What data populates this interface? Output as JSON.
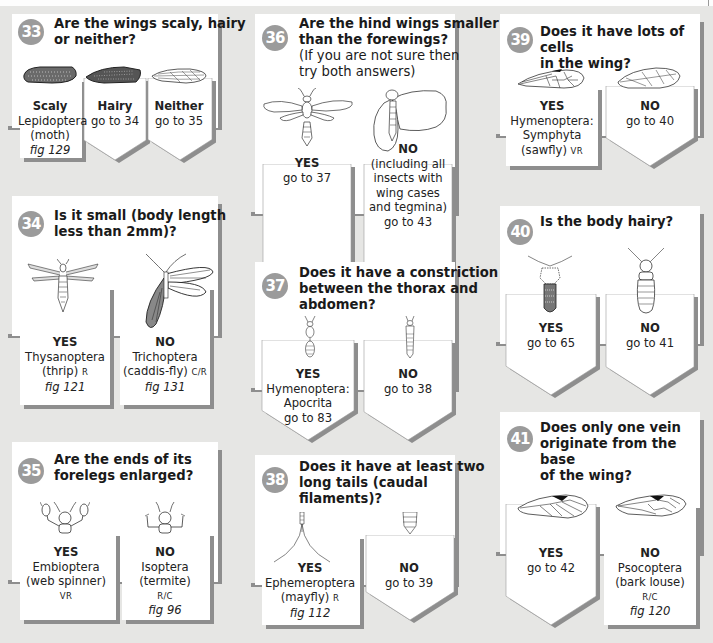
{
  "colors": {
    "background": "#e6e6e4",
    "card": "#ffffff",
    "shadow": "#8e8e8e",
    "badge": "#9b9b9b"
  },
  "cards": [
    {
      "id": "33",
      "question": "Are the wings scaly, hairy or neither?",
      "question_lines": [
        "Are the wings scaly, hairy",
        "or neither?"
      ],
      "options": [
        {
          "label": "Scaly",
          "lines": [
            "Lepidoptera",
            "(moth)"
          ],
          "fig": "fig 129",
          "terminal": true,
          "illustration": "scaly-wing"
        },
        {
          "label": "Hairy",
          "lines": [
            "go to 34"
          ],
          "terminal": false,
          "illustration": "hairy-wing"
        },
        {
          "label": "Neither",
          "lines": [
            "go to 35"
          ],
          "terminal": false,
          "illustration": "veined-wing"
        }
      ]
    },
    {
      "id": "34",
      "question_lines": [
        "Is it small (body length",
        "less than 2mm)?"
      ],
      "options": [
        {
          "label": "YES",
          "lines": [
            "Thysanoptera"
          ],
          "line2": "(thrip)",
          "status": "R",
          "fig": "fig 121",
          "terminal": true,
          "illustration": "thrip"
        },
        {
          "label": "NO",
          "lines": [
            "Trichoptera"
          ],
          "line2": "(caddis-fly)",
          "status": "C/R",
          "fig": "fig 131",
          "terminal": true,
          "illustration": "caddis-fly"
        }
      ]
    },
    {
      "id": "35",
      "question_lines": [
        "Are the ends of its",
        "forelegs enlarged?"
      ],
      "options": [
        {
          "label": "YES",
          "lines": [
            "Embioptera",
            "(web spinner)"
          ],
          "status": "VR",
          "terminal": true,
          "illustration": "web-spinner-head"
        },
        {
          "label": "NO",
          "lines": [
            "Isoptera",
            "(termite)"
          ],
          "status": "R/C",
          "fig": "fig 96",
          "terminal": true,
          "illustration": "termite-head"
        }
      ]
    },
    {
      "id": "36",
      "question_lines": [
        "Are the hind wings smaller",
        "than the forewings?"
      ],
      "sub_lines": [
        "(If you are not sure then",
        "try both answers)"
      ],
      "options": [
        {
          "label": "YES",
          "lines": [
            "go to 37"
          ],
          "terminal": false,
          "illustration": "wasp"
        },
        {
          "label": "NO",
          "lines": [
            "(including all",
            "insects with",
            "wing cases",
            "and tegmina)",
            "go to 43"
          ],
          "terminal": false,
          "illustration": "bug-with-wing-cases"
        }
      ]
    },
    {
      "id": "37",
      "question_lines": [
        "Does it have a constriction",
        "between the thorax and",
        "abdomen?"
      ],
      "options": [
        {
          "label": "YES",
          "lines": [
            "Hymenoptera:",
            "Apocrita",
            "go to 83"
          ],
          "terminal": false,
          "illustration": "constricted-body"
        },
        {
          "label": "NO",
          "lines": [
            "go to 38"
          ],
          "terminal": false,
          "illustration": "unconstricted-body"
        }
      ]
    },
    {
      "id": "38",
      "question_lines": [
        "Does it have at least two",
        "long tails (caudal",
        "filaments)?"
      ],
      "options": [
        {
          "label": "YES",
          "lines": [
            "Ephemeroptera"
          ],
          "line2": "(mayfly)",
          "status": "R",
          "fig": "fig 112",
          "terminal": true,
          "illustration": "tails"
        },
        {
          "label": "NO",
          "lines": [
            "go to 39"
          ],
          "terminal": false,
          "illustration": "no-tails"
        }
      ]
    },
    {
      "id": "39",
      "question_lines": [
        "Does it have lots of cells",
        "in the wing?"
      ],
      "options": [
        {
          "label": "YES",
          "lines": [
            "Hymenoptera:",
            "Symphyta"
          ],
          "line2": "(sawfly)",
          "status": "VR",
          "terminal": true,
          "illustration": "many-cell-wing"
        },
        {
          "label": "NO",
          "lines": [
            "go to 40"
          ],
          "terminal": false,
          "illustration": "few-cell-wing"
        }
      ]
    },
    {
      "id": "40",
      "question_lines": [
        "Is the body hairy?"
      ],
      "options": [
        {
          "label": "YES",
          "lines": [
            "go to 65"
          ],
          "terminal": false,
          "illustration": "hairy-body"
        },
        {
          "label": "NO",
          "lines": [
            "go to 41"
          ],
          "terminal": false,
          "illustration": "smooth-body"
        }
      ]
    },
    {
      "id": "41",
      "question_lines": [
        "Does only one vein",
        "originate from the base",
        "of the wing?"
      ],
      "options": [
        {
          "label": "YES",
          "lines": [
            "go to 42"
          ],
          "terminal": false,
          "illustration": "one-vein-wing"
        },
        {
          "label": "NO",
          "lines": [
            "Psocoptera",
            "(bark louse)"
          ],
          "status": "R/C",
          "fig": "fig 120",
          "terminal": true,
          "illustration": "multi-vein-wing"
        }
      ]
    }
  ]
}
